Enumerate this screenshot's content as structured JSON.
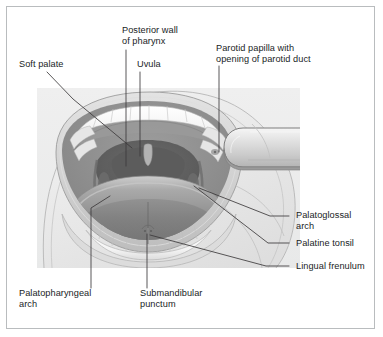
{
  "figure": {
    "frame_color": "#b9bcbe",
    "panel_color": "#eceded",
    "text_color": "#201d1e",
    "leader_line_color": "#3c3a3b"
  },
  "labels": {
    "soft_palate": "Soft palate",
    "posterior_wall_of_pharynx": "Posterior wall\nof pharynx",
    "uvula": "Uvula",
    "parotid_papilla": "Parotid papilla with\nopening of parotid duct",
    "palatoglossal_arch": "Palatoglossal\narch",
    "palatine_tonsil": "Palatine tonsil",
    "lingual_frenulum": "Lingual frenulum",
    "palatopharyngeal_arch": "Palatopharyngeal\narch",
    "submandibular_punctum": "Submandibular\npunctum"
  },
  "structures": {
    "tongue_depressor": "tongue-depressor",
    "upper_teeth": "upper-teeth-row",
    "lower_teeth": "lower-teeth-row",
    "tongue": "tongue",
    "oropharynx": "oropharynx-opening",
    "lips": "lips",
    "face": "face-outline"
  }
}
